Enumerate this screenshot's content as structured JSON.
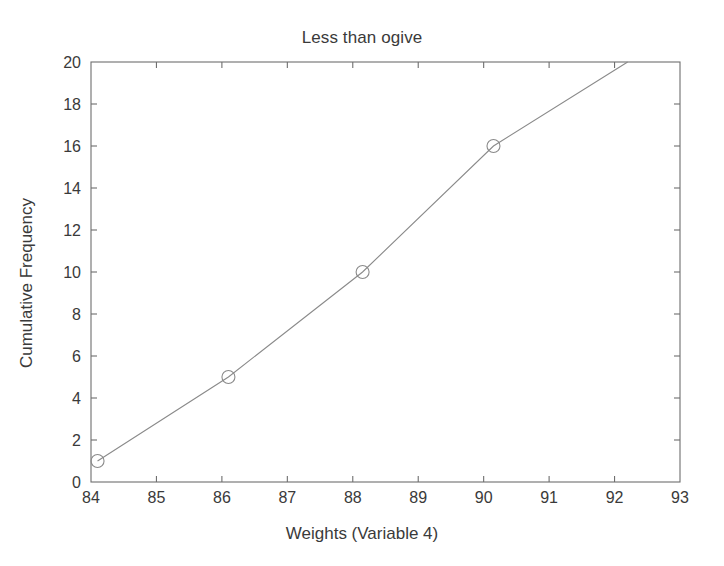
{
  "chart_data": {
    "type": "line",
    "title": "Less than ogive",
    "xlabel": "Weights (Variable 4)",
    "ylabel": "Cumulative Frequency",
    "xlim": [
      84,
      93
    ],
    "ylim": [
      0,
      20
    ],
    "xticks": [
      84,
      85,
      86,
      87,
      88,
      89,
      90,
      91,
      92,
      93
    ],
    "yticks": [
      0,
      2,
      4,
      6,
      8,
      10,
      12,
      14,
      16,
      18,
      20
    ],
    "xtick_labels": [
      "84",
      "85",
      "86",
      "87",
      "88",
      "89",
      "90",
      "91",
      "92",
      "93"
    ],
    "ytick_labels": [
      "0",
      "2",
      "4",
      "6",
      "8",
      "10",
      "12",
      "14",
      "16",
      "18",
      "20"
    ],
    "grid": false,
    "legend": null,
    "marker": "circle-open",
    "line_color": "#8a8a8a",
    "marker_color": "#8a8a8a",
    "axis_color": "#6e6e6e",
    "background": "#ffffff",
    "series": [
      {
        "name": "Less than ogive",
        "x": [
          84.1,
          86.1,
          88.15,
          90.15,
          92.2
        ],
        "y": [
          1,
          5,
          10,
          16,
          20
        ],
        "markers_shown": [
          true,
          true,
          true,
          true,
          false
        ]
      }
    ]
  }
}
